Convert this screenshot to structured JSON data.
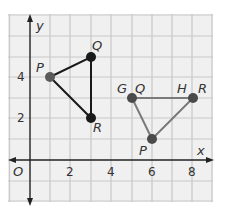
{
  "graph": {
    "axes": {
      "x_label": "x",
      "y_label": "y",
      "origin_label": "O",
      "x_ticks": [
        "2",
        "4",
        "6",
        "8"
      ],
      "y_ticks": [
        "2",
        "4"
      ]
    },
    "colors": {
      "grid_bg": "#f0f0f0",
      "grid_line": "#c8c8c8",
      "axis": "#222222",
      "triangle1_line": "#1a1a1a",
      "triangle2_line": "#7a7a7a",
      "point_dark": "#1a1a1a",
      "point_gray": "#5a5a5a"
    },
    "triangle1": {
      "points": [
        {
          "label": "P",
          "x": 1,
          "y": 4
        },
        {
          "label": "Q",
          "x": 3,
          "y": 5
        },
        {
          "label": "R",
          "x": 3,
          "y": 2
        }
      ]
    },
    "triangle2": {
      "points": [
        {
          "label": "G Q",
          "label_a": "G",
          "label_b": "Q",
          "x": 5,
          "y": 3
        },
        {
          "label": "H R",
          "label_a": "H",
          "label_b": "R",
          "x": 8,
          "y": 3
        },
        {
          "label": "P",
          "x": 6,
          "y": 1
        }
      ]
    }
  }
}
